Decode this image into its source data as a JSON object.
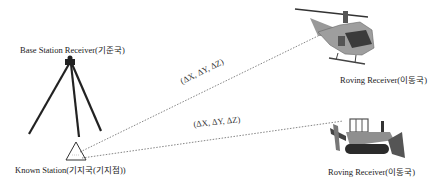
{
  "labels": {
    "base_station": "Base Station Receiver(기준국)",
    "known_station": "Known Station(기지국(기지점))",
    "rover_helicopter": "Roving Receiver(이동국)",
    "rover_bulldozer": "Roving Receiver(이동국)",
    "baseline_helicopter": "(ΔX, ΔY, ΔZ)",
    "baseline_bulldozer": "(ΔX, ΔY, ΔZ)"
  },
  "icons": {
    "base": "tripod-gnss-receiver-icon",
    "known_point": "triangle-survey-marker-icon",
    "rover1": "helicopter-icon",
    "rover2": "bulldozer-icon"
  },
  "colors": {
    "line": "#555555",
    "vehicle_body": "#9a9a9a",
    "vehicle_dark": "#3a3a3a"
  }
}
